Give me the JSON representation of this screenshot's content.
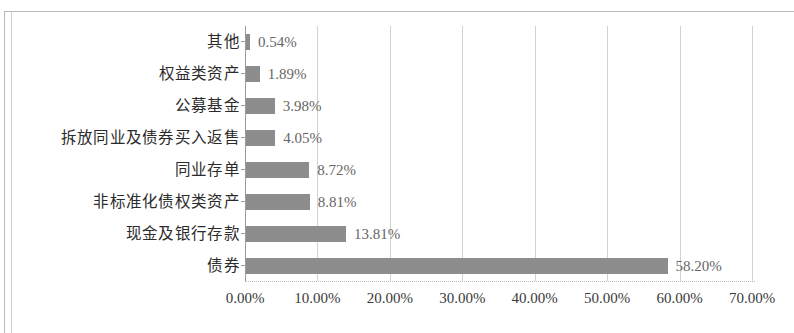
{
  "chart_data": {
    "type": "bar",
    "orientation": "horizontal",
    "title": "",
    "subtitle": "",
    "xlabel": "",
    "ylabel": "",
    "categories": [
      "其他",
      "权益类资产",
      "公募基金",
      "拆放同业及债券买入返售",
      "同业存单",
      "非标准化债权类资产",
      "现金及银行存款",
      "债券"
    ],
    "values": [
      0.54,
      1.89,
      3.98,
      4.05,
      8.72,
      8.81,
      13.81,
      58.2
    ],
    "value_labels": [
      "0.54%",
      "1.89%",
      "3.98%",
      "4.05%",
      "8.72%",
      "8.81%",
      "13.81%",
      "58.20%"
    ],
    "xlim": [
      0,
      70
    ],
    "xticks": [
      0,
      10,
      20,
      30,
      40,
      50,
      60,
      70
    ],
    "xtick_labels": [
      "0.00%",
      "10.00%",
      "20.00%",
      "30.00%",
      "40.00%",
      "50.00%",
      "60.00%",
      "70.00%"
    ],
    "grid": true,
    "grid_axis": "x",
    "legend": false,
    "series": [
      {
        "name": "",
        "values": [
          0.54,
          1.89,
          3.98,
          4.05,
          8.72,
          8.81,
          13.81,
          58.2
        ]
      }
    ],
    "colors": {
      "bar": "#8d8d8d",
      "gridline": "#d2d2d2",
      "axis": "#9b9b9b",
      "value_label": "#666666",
      "category_label": "#2b2b2b",
      "tick_label": "#3a3a3a",
      "background": "#ffffff",
      "frame": "#b9b9b9"
    }
  }
}
